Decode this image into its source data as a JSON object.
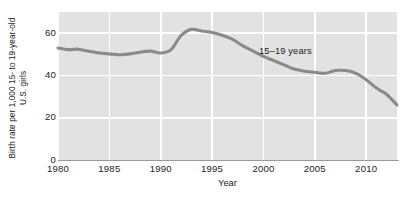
{
  "chart_data": {
    "type": "line",
    "title": "",
    "xlabel": "Year",
    "ylabel_line1": "Birth rate per 1,000 15- to 19-year-old",
    "ylabel_line2": "U.S. girls",
    "xlim": [
      1980,
      2013
    ],
    "ylim": [
      0,
      70
    ],
    "yticks": [
      0,
      20,
      40,
      60
    ],
    "ytick_labels": [
      "0",
      "20",
      "40",
      "60"
    ],
    "xticks": [
      1980,
      1985,
      1990,
      1995,
      2000,
      2005,
      2010
    ],
    "xtick_labels": [
      "1980",
      "1985",
      "1990",
      "1995",
      "2000",
      "2005",
      "2010"
    ],
    "grid": true,
    "grid_color": "#ffffff",
    "plot_background": "#e2e2e2",
    "legend_position": "inline-annotation",
    "annotations": [
      {
        "text": "15–19 years",
        "x": 2001,
        "y": 49
      }
    ],
    "series": [
      {
        "name": "15–19 years",
        "color": "#8a8a8a",
        "x": [
          1980,
          1981,
          1982,
          1983,
          1984,
          1985,
          1986,
          1987,
          1988,
          1989,
          1990,
          1991,
          1992,
          1993,
          1994,
          1995,
          1996,
          1997,
          1998,
          1999,
          2000,
          2001,
          2002,
          2003,
          2004,
          2005,
          2006,
          2007,
          2008,
          2009,
          2010,
          2011,
          2012,
          2013
        ],
        "values": [
          53.0,
          52.2,
          52.4,
          51.4,
          50.6,
          50.2,
          49.8,
          50.2,
          51.0,
          51.5,
          50.6,
          52.2,
          59.0,
          61.8,
          61.0,
          60.3,
          59.0,
          57.0,
          54.0,
          51.5,
          49.0,
          47.0,
          45.0,
          43.0,
          42.0,
          41.5,
          41.0,
          42.3,
          42.3,
          41.0,
          38.0,
          34.0,
          31.0,
          26.0
        ]
      }
    ]
  }
}
